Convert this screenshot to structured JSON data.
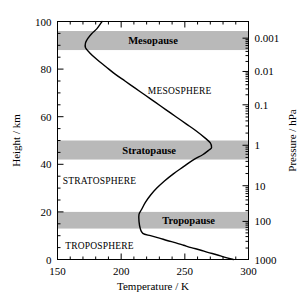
{
  "chart_data": {
    "type": "line",
    "title": "",
    "xlabel": "Temperature / K",
    "ylabel": "Height / km",
    "y2label": "Pressure / hPa",
    "xlim": [
      150,
      300
    ],
    "ylim": [
      0,
      100
    ],
    "xticks": [
      150,
      200,
      250,
      300
    ],
    "xtick_labels": [
      "150",
      "200",
      "250",
      "300"
    ],
    "xminor_step": 10,
    "yticks": [
      0,
      20,
      40,
      60,
      80,
      100
    ],
    "ytick_labels": [
      "0",
      "20",
      "40",
      "60",
      "80",
      "100"
    ],
    "yminor_step": 5,
    "y2_scale": "log",
    "y2_ticks_hpa": [
      1000,
      100,
      10,
      1,
      0.1,
      0.01,
      0.001
    ],
    "y2_tick_labels": [
      "1000",
      "100",
      "10",
      "1",
      "0.1",
      "0.01",
      "0.001"
    ],
    "y2_tick_heights_km": [
      0,
      16,
      31,
      48,
      65,
      79,
      93
    ],
    "grid": false,
    "legend": false,
    "series": [
      {
        "name": "Standard atmosphere temperature profile",
        "color": "#000000",
        "x_is_temperature": true,
        "points": [
          {
            "t": 288,
            "h": 0
          },
          {
            "t": 281,
            "h": 1
          },
          {
            "t": 275,
            "h": 2
          },
          {
            "t": 268,
            "h": 3
          },
          {
            "t": 262,
            "h": 4
          },
          {
            "t": 255,
            "h": 5
          },
          {
            "t": 249,
            "h": 6
          },
          {
            "t": 243,
            "h": 7
          },
          {
            "t": 236,
            "h": 8
          },
          {
            "t": 230,
            "h": 9
          },
          {
            "t": 223,
            "h": 10
          },
          {
            "t": 217,
            "h": 11
          },
          {
            "t": 215,
            "h": 13
          },
          {
            "t": 214,
            "h": 16
          },
          {
            "t": 214,
            "h": 19
          },
          {
            "t": 216,
            "h": 21
          },
          {
            "t": 219,
            "h": 24
          },
          {
            "t": 223,
            "h": 27
          },
          {
            "t": 228,
            "h": 30
          },
          {
            "t": 234,
            "h": 33
          },
          {
            "t": 241,
            "h": 36
          },
          {
            "t": 249,
            "h": 39
          },
          {
            "t": 257,
            "h": 42
          },
          {
            "t": 264,
            "h": 44
          },
          {
            "t": 269,
            "h": 46
          },
          {
            "t": 271,
            "h": 47
          },
          {
            "t": 270,
            "h": 49
          },
          {
            "t": 266,
            "h": 51
          },
          {
            "t": 259,
            "h": 54
          },
          {
            "t": 251,
            "h": 57
          },
          {
            "t": 243,
            "h": 60
          },
          {
            "t": 235,
            "h": 63
          },
          {
            "t": 227,
            "h": 66
          },
          {
            "t": 219,
            "h": 69
          },
          {
            "t": 211,
            "h": 72
          },
          {
            "t": 203,
            "h": 75
          },
          {
            "t": 195,
            "h": 78
          },
          {
            "t": 188,
            "h": 81
          },
          {
            "t": 181,
            "h": 84
          },
          {
            "t": 175,
            "h": 87
          },
          {
            "t": 172,
            "h": 89
          },
          {
            "t": 172,
            "h": 91
          },
          {
            "t": 174,
            "h": 93
          },
          {
            "t": 177,
            "h": 95
          },
          {
            "t": 181,
            "h": 97
          },
          {
            "t": 185,
            "h": 100
          }
        ]
      }
    ],
    "bands": [
      {
        "name": "mesopause",
        "label": "Mesopause",
        "h_min": 88,
        "h_max": 96,
        "label_t": 225,
        "color": "#b3b3b3"
      },
      {
        "name": "stratopause",
        "label": "Stratopause",
        "h_min": 42,
        "h_max": 50,
        "label_t": 222,
        "color": "#b3b3b3"
      },
      {
        "name": "tropopause",
        "label": "Tropopause",
        "h_min": 13,
        "h_max": 20,
        "label_t": 253,
        "color": "#b3b3b3"
      }
    ],
    "layer_labels": [
      {
        "name": "mesosphere",
        "text": "MESOSPHERE",
        "t": 246,
        "h": 71
      },
      {
        "name": "stratosphere",
        "text": "STRATOSPHERE",
        "t": 183,
        "h": 33
      },
      {
        "name": "troposphere",
        "text": "TROPOSPHERE",
        "t": 183,
        "h": 6
      }
    ]
  }
}
